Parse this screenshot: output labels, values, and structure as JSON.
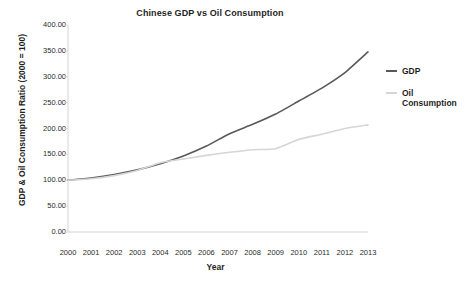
{
  "chart_data": {
    "type": "line",
    "title": "Chinese GDP vs Oil Consumption",
    "xlabel": "Year",
    "ylabel": "GDP & Oil Consumption Ratio (2000 = 100)",
    "categories": [
      "2000",
      "2001",
      "2002",
      "2003",
      "2004",
      "2005",
      "2006",
      "2007",
      "2008",
      "2009",
      "2010",
      "2011",
      "2012",
      "2013"
    ],
    "x": [
      2000,
      2001,
      2002,
      2003,
      2004,
      2005,
      2006,
      2007,
      2008,
      2009,
      2010,
      2011,
      2012,
      2013
    ],
    "series": [
      {
        "name": "GDP",
        "color": "#595959",
        "values": [
          100.0,
          104.5,
          111.0,
          120.0,
          132.0,
          147.0,
          166.0,
          190.0,
          208.0,
          228.0,
          253.0,
          278.0,
          308.0,
          348.0
        ]
      },
      {
        "name": "Oil Consumption",
        "color": "#d6d6d6",
        "values": [
          100.0,
          103.0,
          109.0,
          119.0,
          134.0,
          141.0,
          148.0,
          154.0,
          159.0,
          161.0,
          179.0,
          189.0,
          200.0,
          207.0
        ]
      }
    ],
    "ylim": [
      0,
      400
    ],
    "yticks": [
      0,
      50,
      100,
      150,
      200,
      250,
      300,
      350,
      400
    ],
    "ytick_labels": [
      "0.00",
      "50.00",
      "100.00",
      "150.00",
      "200.00",
      "250.00",
      "300.00",
      "350.00",
      "400.00"
    ],
    "xlim": [
      2000,
      2013
    ],
    "grid": false,
    "legend_position": "right",
    "markers": false
  },
  "legend": {
    "entries": [
      {
        "label": "GDP",
        "color": "#595959"
      },
      {
        "label": "Oil Consumption",
        "color": "#d6d6d6"
      }
    ]
  },
  "axes": {
    "axis_line_color": "#d0d0d0",
    "background": "#ffffff"
  }
}
